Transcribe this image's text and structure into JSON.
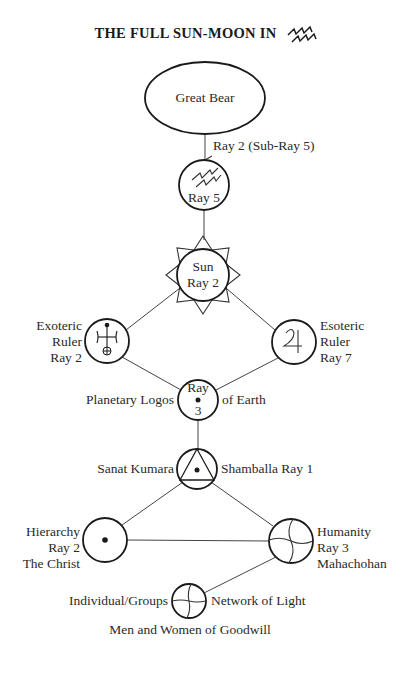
{
  "title": {
    "text": "THE FULL SUN-MOON IN",
    "sign_icon": "aquarius-sign"
  },
  "nodes": {
    "great_bear": {
      "label": "Great Bear"
    },
    "arrow_label": "Ray 2 (Sub-Ray 5)",
    "aquarius": {
      "label": "Ray 5",
      "icon": "aquarius-lightning-glyph"
    },
    "sun": {
      "line1": "Sun",
      "line2": "Ray 2"
    },
    "exoteric": {
      "line1": "Exoteric",
      "line2": "Ruler",
      "line3": "Ray 2",
      "icon": "uranus-glyph"
    },
    "esoteric": {
      "line1": "Esoteric",
      "line2": "Ruler",
      "line3": "Ray 7",
      "icon": "jupiter-glyph"
    },
    "planetary_logos": {
      "left": "Planetary Logos",
      "right": "of Earth",
      "top": "Ray",
      "bottom": "3"
    },
    "sanat_kumara": {
      "left": "Sanat Kumara",
      "right": "Shamballa Ray 1",
      "icon": "triangle-in-circle"
    },
    "hierarchy": {
      "line1": "Hierarchy",
      "line2": "Ray 2",
      "line3": "The Christ",
      "icon": "point-in-circle"
    },
    "humanity": {
      "line1": "Humanity",
      "line2": "Ray 3",
      "line3": "Mahachohan",
      "icon": "wavy-cross-circle"
    },
    "individual": {
      "left": "Individual/Groups",
      "right": "Network of Light",
      "bottom": "Men and Women of Goodwill",
      "icon": "cross-circle"
    }
  },
  "colors": {
    "ink": "#1a1a1a",
    "line": "#444444",
    "background": "#ffffff"
  }
}
